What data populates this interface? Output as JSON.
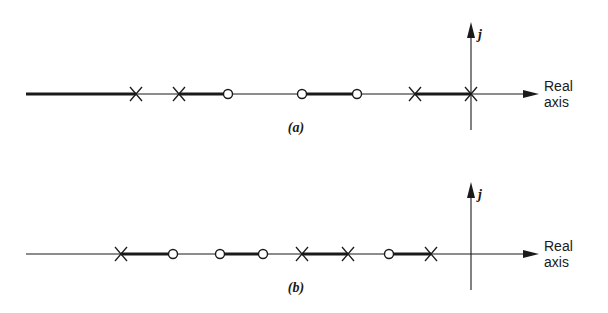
{
  "diagrams": [
    {
      "id": "a",
      "caption": "(a)",
      "axis_y": 94,
      "line_start_x": 26,
      "origin_x": 471,
      "j_label": "j",
      "real_label_line1": "Real",
      "real_label_line2": "axis",
      "poles_x": [
        136,
        179,
        415,
        471
      ],
      "zeros_x": [
        228,
        302,
        357
      ],
      "thick_segments": [
        [
          26,
          136
        ],
        [
          179,
          228
        ],
        [
          302,
          357
        ],
        [
          415,
          471
        ]
      ]
    },
    {
      "id": "b",
      "caption": "(b)",
      "axis_y": 254,
      "line_start_x": 26,
      "origin_x": 471,
      "j_label": "j",
      "real_label_line1": "Real",
      "real_label_line2": "axis",
      "poles_x": [
        121,
        302,
        348,
        431
      ],
      "zeros_x": [
        173,
        220,
        263,
        389
      ],
      "thick_segments": [
        [
          121,
          173
        ],
        [
          220,
          263
        ],
        [
          302,
          348
        ],
        [
          389,
          431
        ]
      ]
    }
  ],
  "colors": {
    "ink": "#1a1a1a",
    "background": "#ffffff"
  }
}
